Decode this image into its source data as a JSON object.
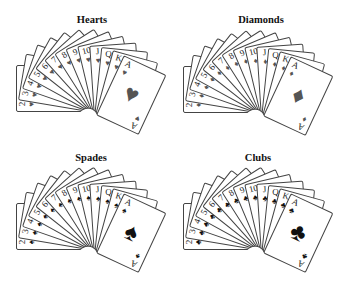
{
  "ranks": [
    "2",
    "3",
    "4",
    "5",
    "6",
    "7",
    "8",
    "9",
    "10",
    "J",
    "Q",
    "K",
    "A"
  ],
  "fans": [
    {
      "name": "hearts",
      "title": "Hearts",
      "symbol": "♥",
      "color_class": "red",
      "pivot": [
        88,
        118
      ],
      "title_pos": [
        52,
        14
      ]
    },
    {
      "name": "diamonds",
      "title": "Diamonds",
      "symbol": "♦",
      "color_class": "red",
      "pivot": [
        255,
        119
      ],
      "title_pos": [
        221,
        14
      ]
    },
    {
      "name": "spades",
      "title": "Spades",
      "symbol": "♠",
      "color_class": "black",
      "pivot": [
        88,
        256
      ],
      "title_pos": [
        51,
        152
      ]
    },
    {
      "name": "clubs",
      "title": "Clubs",
      "symbol": "♣",
      "color_class": "black",
      "pivot": [
        255,
        256
      ],
      "title_pos": [
        218,
        152
      ]
    }
  ],
  "fan_angles": {
    "start": -90,
    "end": 25
  },
  "colors": {
    "red_suit": "#555555",
    "black_suit": "#111111",
    "card_border": "#444444",
    "background": "#ffffff"
  }
}
